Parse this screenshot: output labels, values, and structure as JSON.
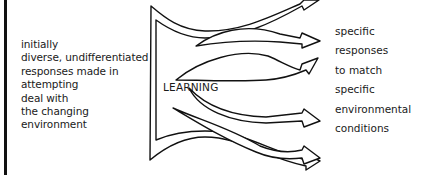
{
  "diagram": {
    "left_label_lines": [
      "initially",
      "diverse, undifferentiated",
      "responses made in",
      "attempting",
      "deal with",
      "the changing",
      "environment"
    ],
    "center_label": "LEARNING",
    "right_label_lines": [
      "specific",
      "responses",
      "to match",
      "specific",
      "environmental",
      "conditions"
    ],
    "arrow_count": 6,
    "colors": {
      "stroke": "#111111",
      "background": "#ffffff",
      "text": "#1a1a1a"
    }
  }
}
